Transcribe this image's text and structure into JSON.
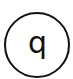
{
  "symbol": {
    "letter": "q",
    "shape": "circle",
    "stroke_color": "#111111",
    "background_color": "#ffffff"
  }
}
